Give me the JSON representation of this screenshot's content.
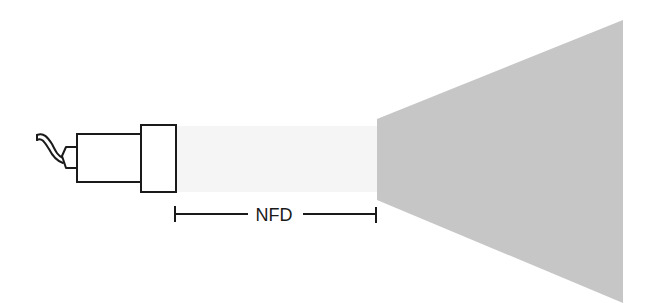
{
  "diagram": {
    "labels": {
      "distance": "NFD"
    },
    "colors": {
      "stroke": "#1a1a1a",
      "beam_cone": "#c4c4c4",
      "beam_faint": "#f4f4f4",
      "background": "#ffffff"
    },
    "elements": {
      "camera": "camera-with-cable",
      "lens": "lens-housing",
      "beam": "light-cone",
      "dimension": "dimension-line-nfd"
    }
  }
}
